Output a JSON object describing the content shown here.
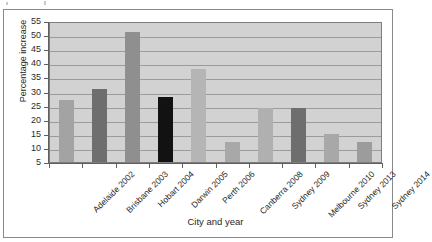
{
  "chart_data": {
    "type": "bar",
    "title": "",
    "xlabel": "City and year",
    "ylabel": "Percentage increase",
    "categories": [
      "Adelaide 2002",
      "Brisbane 2003",
      "Hobart 2004",
      "Darwin 2005",
      "Perth 2006",
      "Canberra 2008",
      "Sydney 2009",
      "Melbourne 2010",
      "Sydney 2013",
      "Sydney 2014"
    ],
    "values": [
      27,
      31,
      51,
      28,
      38,
      12,
      24,
      24,
      15,
      12
    ],
    "bar_colors": [
      "#a3a3a3",
      "#6e6e6e",
      "#8f8f8f",
      "#121212",
      "#b5b5b5",
      "#a8a8a8",
      "#b0b0b0",
      "#6e6e6e",
      "#a8a8a8",
      "#9c9c9c"
    ],
    "ylim": [
      5,
      55
    ],
    "ytick_labels": [
      "55",
      "50",
      "45",
      "40",
      "35",
      "30",
      "25",
      "20",
      "15",
      "10",
      "5"
    ],
    "ytick_values": [
      55,
      50,
      45,
      40,
      35,
      30,
      25,
      20,
      15,
      10,
      5
    ],
    "grid": true,
    "legend": "none",
    "plot_background": "#d2d2d2",
    "gridline_color": "#9b9b9b",
    "axis_color": "#5f5f5f"
  }
}
